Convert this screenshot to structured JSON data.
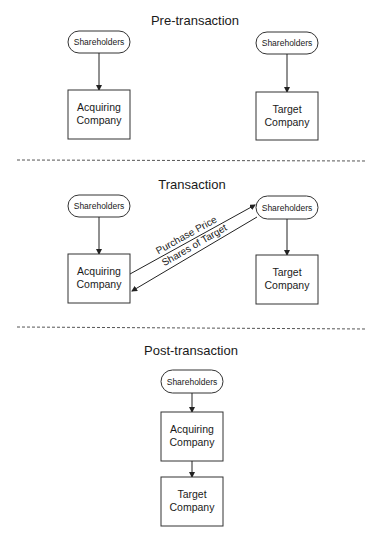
{
  "sections": {
    "pre": {
      "title": "Pre-transaction",
      "left_shareholders": "Shareholders",
      "right_shareholders": "Shareholders",
      "acquiring": [
        "Acquiring",
        "Company"
      ],
      "target": [
        "Target",
        "Company"
      ]
    },
    "transaction": {
      "title": "Transaction",
      "left_shareholders": "Shareholders",
      "right_shareholders": "Shareholders",
      "acquiring": [
        "Acquiring",
        "Company"
      ],
      "target": [
        "Target",
        "Company"
      ],
      "flow_to_target_shareholders": "Purchase Price",
      "flow_to_acquirer": "Shares of Target"
    },
    "post": {
      "title": "Post-transaction",
      "shareholders": "Shareholders",
      "acquiring": [
        "Acquiring",
        "Company"
      ],
      "target": [
        "Target",
        "Company"
      ]
    }
  },
  "colors": {
    "line": "#222222",
    "background": "#ffffff"
  }
}
